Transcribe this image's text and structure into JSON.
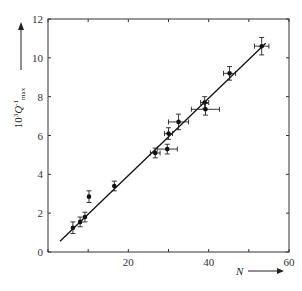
{
  "chart_data": {
    "type": "scatter",
    "title": "",
    "xlabel": "N",
    "ylabel": "10^3 Q^-1_max",
    "ylabel_parts": {
      "base": "10",
      "exp": "3",
      "q": "Q",
      "qexp": "-1",
      "sub": "max"
    },
    "xlim": [
      0,
      60
    ],
    "ylim": [
      0,
      12
    ],
    "xticks": [
      0,
      10,
      20,
      30,
      40,
      50,
      60
    ],
    "xtick_labels": [
      "",
      "",
      "20",
      "",
      "40",
      "",
      "60"
    ],
    "yticks": [
      0,
      2,
      4,
      6,
      8,
      10,
      12
    ],
    "ytick_labels": [
      "0",
      "2",
      "4",
      "6",
      "8",
      "10",
      "12"
    ],
    "grid": false,
    "legend": null,
    "series": [
      {
        "name": "data",
        "marker": "filled-circle",
        "error_bars": true,
        "points": [
          {
            "x": 6.2,
            "y": 1.25,
            "xerr": 0.0,
            "yerr": 0.3
          },
          {
            "x": 8.0,
            "y": 1.55,
            "xerr": 0.0,
            "yerr": 0.25
          },
          {
            "x": 9.2,
            "y": 1.8,
            "xerr": 0.0,
            "yerr": 0.25
          },
          {
            "x": 10.2,
            "y": 2.85,
            "xerr": 0.0,
            "yerr": 0.3
          },
          {
            "x": 16.5,
            "y": 3.4,
            "xerr": 0.0,
            "yerr": 0.25
          },
          {
            "x": 26.7,
            "y": 5.1,
            "xerr": 1.2,
            "yerr": 0.25
          },
          {
            "x": 29.7,
            "y": 5.3,
            "xerr": 2.5,
            "yerr": 0.25
          },
          {
            "x": 30.0,
            "y": 6.1,
            "xerr": 1.0,
            "yerr": 0.3
          },
          {
            "x": 32.5,
            "y": 6.7,
            "xerr": 2.5,
            "yerr": 0.4
          },
          {
            "x": 39.0,
            "y": 7.7,
            "xerr": 1.0,
            "yerr": 0.3
          },
          {
            "x": 39.2,
            "y": 7.35,
            "xerr": 3.5,
            "yerr": 0.3
          },
          {
            "x": 45.2,
            "y": 9.2,
            "xerr": 1.5,
            "yerr": 0.35
          },
          {
            "x": 53.2,
            "y": 10.6,
            "xerr": 1.8,
            "yerr": 0.45
          }
        ]
      },
      {
        "name": "linear fit",
        "type": "line",
        "points": [
          {
            "x": 3.0,
            "y": 0.55
          },
          {
            "x": 54.2,
            "y": 10.75
          }
        ]
      }
    ],
    "annotations": [
      "N arrow pointing right",
      "y-label arrow pointing up"
    ]
  }
}
